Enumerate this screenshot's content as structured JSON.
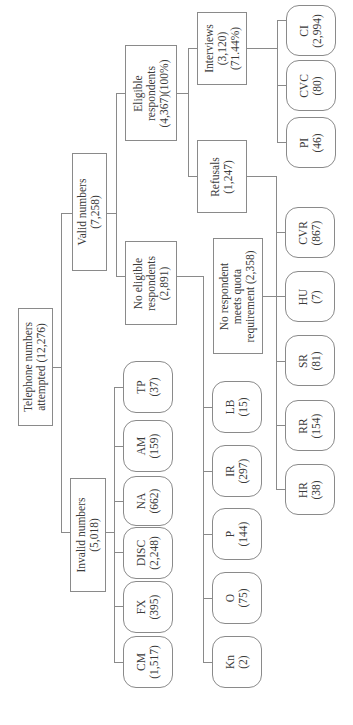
{
  "diagram": {
    "root": {
      "line1": "Telephone numbers",
      "line2": "attempted (12,276)"
    },
    "valid": {
      "line1": "Valid numbers",
      "line2": "(7,258)"
    },
    "invalid": {
      "line1": "Invalid numbers",
      "line2": "(5,018)"
    },
    "eligible": {
      "line1": "Eligible",
      "line2": "respondents",
      "line3": "(4,367)(100%)"
    },
    "no_eligible": {
      "line1": "No eligible",
      "line2": "respondents",
      "line3": "(2,891)"
    },
    "interviews": {
      "line1": "Interviews",
      "line2": "(3,120)",
      "line3": "(71.44%)"
    },
    "refusals": {
      "line1": "Refusals",
      "line2": "(1,247)"
    },
    "no_quota": {
      "line1": "No respondent",
      "line2": "meets quota",
      "line3": "requirement (2,358)"
    },
    "invalid_children": [
      {
        "code": "TP",
        "count": "(37)"
      },
      {
        "code": "AM",
        "count": "(159)"
      },
      {
        "code": "NA",
        "count": "(662)"
      },
      {
        "code": "DISC",
        "count": "(2,248)"
      },
      {
        "code": "FX",
        "count": "(395)"
      },
      {
        "code": "CM",
        "count": "(1,517)"
      }
    ],
    "no_eligible_children": [
      {
        "code": "LB",
        "count": "(15)"
      },
      {
        "code": "IR",
        "count": "(297)"
      },
      {
        "code": "P",
        "count": "(144)"
      },
      {
        "code": "O",
        "count": "(75)"
      },
      {
        "code": "Kn",
        "count": "(2)"
      }
    ],
    "interview_children": [
      {
        "code": "CI",
        "count": "(2,994)"
      },
      {
        "code": "CVC",
        "count": "(80)"
      },
      {
        "code": "PI",
        "count": "(46)"
      }
    ],
    "refusal_children": [
      {
        "code": "CVR",
        "count": "(867)"
      },
      {
        "code": "HU",
        "count": "(7)"
      },
      {
        "code": "SR",
        "count": "(81)"
      },
      {
        "code": "RR",
        "count": "(154)"
      },
      {
        "code": "HR",
        "count": "(38)"
      }
    ]
  }
}
